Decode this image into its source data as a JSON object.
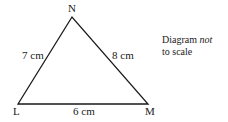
{
  "diagram": {
    "type": "triangle",
    "vertices": {
      "N": {
        "label": "N",
        "x": 72,
        "y": 17
      },
      "L": {
        "label": "L",
        "x": 18,
        "y": 104
      },
      "M": {
        "label": "M",
        "x": 148,
        "y": 104
      }
    },
    "sides": {
      "LN": "7 cm",
      "NM": "8 cm",
      "LM": "6 cm"
    },
    "note": {
      "line1_prefix": "Diagram ",
      "line1_emphasis": "not",
      "line2": "to scale"
    },
    "colors": {
      "stroke": "#1a1a1a",
      "background": "#ffffff"
    }
  }
}
